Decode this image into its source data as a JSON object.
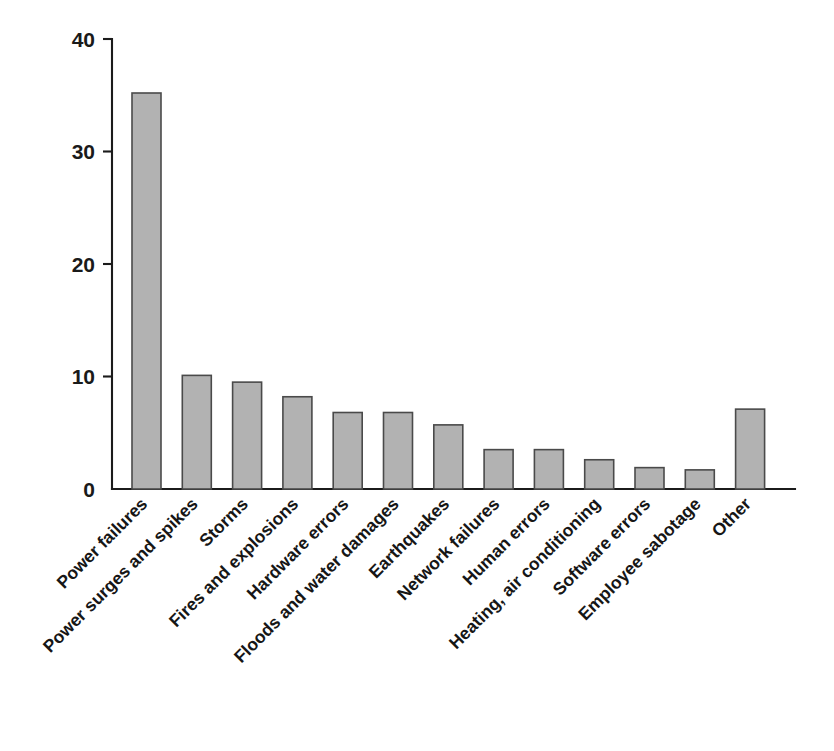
{
  "chart_data": {
    "type": "bar",
    "title": "",
    "subtitle": "",
    "xlabel": "",
    "ylabel": "",
    "ylim": [
      0,
      40
    ],
    "yticks": [
      0,
      10,
      20,
      30,
      40
    ],
    "ytick_labels": [
      "0",
      "10",
      "20",
      "30",
      "40"
    ],
    "grid": false,
    "legend": false,
    "legend_position": "none",
    "annotations": [],
    "bar_fill_color": "#b2b2b2",
    "bar_edge_color": "#4a4a4a",
    "axis_color": "#1b1b1b",
    "background_color": "#ffffff",
    "categories": [
      "Power failures",
      "Power surges and spikes",
      "Storms",
      "Fires and explosions",
      "Hardware errors",
      "Floods and water damages",
      "Earthquakes",
      "Network failures",
      "Human errors",
      "Heating, air conditioning",
      "Software errors",
      "Employee sabotage",
      "Other"
    ],
    "values": [
      35.2,
      10.1,
      9.5,
      8.2,
      6.8,
      6.8,
      5.7,
      3.5,
      3.5,
      2.6,
      1.9,
      1.7,
      7.1
    ]
  }
}
